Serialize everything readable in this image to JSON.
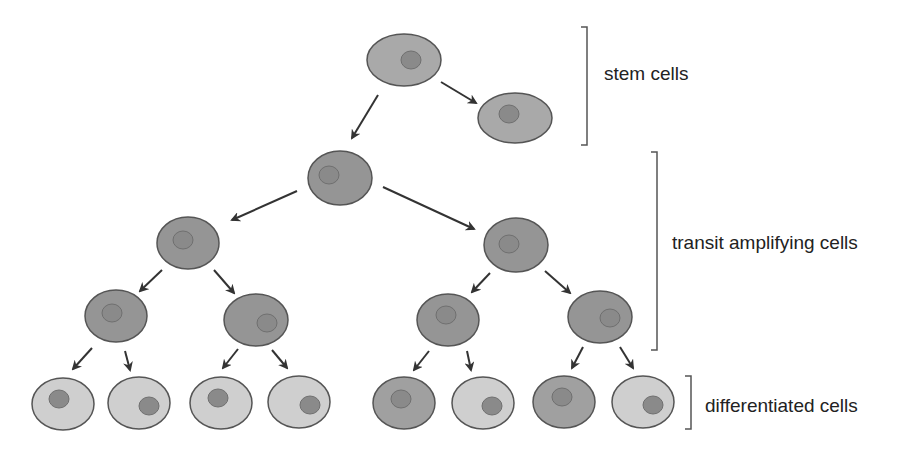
{
  "diagram": {
    "title": "",
    "labels": {
      "stem": "stem cells",
      "transit": "transit amplifying cells",
      "differentiated": "differentiated cells"
    },
    "colors": {
      "stem_fill": "#a9a9a9",
      "transit_fill": "#959595",
      "differentiated_light_fill": "#cfcfcf",
      "differentiated_dark_fill": "#a0a0a0",
      "nucleus_fill": "#8a8a8a",
      "outline": "#555555",
      "arrow": "#333333",
      "bracket": "#555555"
    },
    "nodes": [
      {
        "id": "stem-1",
        "level": "stem",
        "cx": 404,
        "cy": 60,
        "rx": 37,
        "ry": 26,
        "nx": 411,
        "ny": 60,
        "fill": "stem"
      },
      {
        "id": "stem-2",
        "level": "stem",
        "cx": 515,
        "cy": 118,
        "rx": 37,
        "ry": 25,
        "nx": 509,
        "ny": 114,
        "fill": "stem"
      },
      {
        "id": "ta-1",
        "level": "transit",
        "cx": 340,
        "cy": 178,
        "rx": 32,
        "ry": 27,
        "nx": 329,
        "ny": 175,
        "fill": "transit"
      },
      {
        "id": "ta-2",
        "level": "transit",
        "cx": 188,
        "cy": 243,
        "rx": 31,
        "ry": 26,
        "nx": 183,
        "ny": 240,
        "fill": "transit"
      },
      {
        "id": "ta-3",
        "level": "transit",
        "cx": 516,
        "cy": 245,
        "rx": 32,
        "ry": 27,
        "nx": 509,
        "ny": 244,
        "fill": "transit"
      },
      {
        "id": "ta-4",
        "level": "transit",
        "cx": 116,
        "cy": 316,
        "rx": 31,
        "ry": 26,
        "nx": 112,
        "ny": 313,
        "fill": "transit"
      },
      {
        "id": "ta-5",
        "level": "transit",
        "cx": 256,
        "cy": 320,
        "rx": 32,
        "ry": 26,
        "nx": 267,
        "ny": 323,
        "fill": "transit"
      },
      {
        "id": "ta-6",
        "level": "transit",
        "cx": 448,
        "cy": 320,
        "rx": 31,
        "ry": 26,
        "nx": 446,
        "ny": 315,
        "fill": "transit"
      },
      {
        "id": "ta-7",
        "level": "transit",
        "cx": 600,
        "cy": 317,
        "rx": 32,
        "ry": 26,
        "nx": 610,
        "ny": 318,
        "fill": "transit"
      },
      {
        "id": "diff-1",
        "level": "differentiated",
        "cx": 63,
        "cy": 404,
        "rx": 31,
        "ry": 26,
        "nx": 59,
        "ny": 399,
        "fill": "light"
      },
      {
        "id": "diff-2",
        "level": "differentiated",
        "cx": 139,
        "cy": 403,
        "rx": 31,
        "ry": 26,
        "nx": 149,
        "ny": 406,
        "fill": "light"
      },
      {
        "id": "diff-3",
        "level": "differentiated",
        "cx": 221,
        "cy": 403,
        "rx": 31,
        "ry": 26,
        "nx": 218,
        "ny": 398,
        "fill": "light"
      },
      {
        "id": "diff-4",
        "level": "differentiated",
        "cx": 299,
        "cy": 402,
        "rx": 31,
        "ry": 26,
        "nx": 310,
        "ny": 405,
        "fill": "light"
      },
      {
        "id": "diff-5",
        "level": "differentiated",
        "cx": 404,
        "cy": 403,
        "rx": 31,
        "ry": 26,
        "nx": 401,
        "ny": 399,
        "fill": "dark"
      },
      {
        "id": "diff-6",
        "level": "differentiated",
        "cx": 483,
        "cy": 403,
        "rx": 31,
        "ry": 26,
        "nx": 492,
        "ny": 406,
        "fill": "light"
      },
      {
        "id": "diff-7",
        "level": "differentiated",
        "cx": 564,
        "cy": 402,
        "rx": 31,
        "ry": 26,
        "nx": 562,
        "ny": 397,
        "fill": "dark"
      },
      {
        "id": "diff-8",
        "level": "differentiated",
        "cx": 643,
        "cy": 402,
        "rx": 31,
        "ry": 26,
        "nx": 653,
        "ny": 405,
        "fill": "light"
      }
    ],
    "arrows": [
      {
        "from": "stem-1",
        "to": "ta-1",
        "x1": 378,
        "y1": 95,
        "x2": 352,
        "y2": 138
      },
      {
        "from": "stem-1",
        "to": "stem-2",
        "x1": 441,
        "y1": 82,
        "x2": 476,
        "y2": 103
      },
      {
        "from": "ta-1",
        "to": "ta-2",
        "x1": 297,
        "y1": 191,
        "x2": 232,
        "y2": 220
      },
      {
        "from": "ta-1",
        "to": "ta-3",
        "x1": 383,
        "y1": 187,
        "x2": 474,
        "y2": 229
      },
      {
        "from": "ta-2",
        "to": "ta-4",
        "x1": 162,
        "y1": 270,
        "x2": 140,
        "y2": 291
      },
      {
        "from": "ta-2",
        "to": "ta-5",
        "x1": 214,
        "y1": 270,
        "x2": 234,
        "y2": 293
      },
      {
        "from": "ta-3",
        "to": "ta-6",
        "x1": 490,
        "y1": 273,
        "x2": 472,
        "y2": 292
      },
      {
        "from": "ta-3",
        "to": "ta-7",
        "x1": 545,
        "y1": 271,
        "x2": 570,
        "y2": 293
      },
      {
        "from": "ta-4",
        "to": "diff-1",
        "x1": 92,
        "y1": 348,
        "x2": 73,
        "y2": 369
      },
      {
        "from": "ta-4",
        "to": "diff-2",
        "x1": 125,
        "y1": 351,
        "x2": 130,
        "y2": 370
      },
      {
        "from": "ta-5",
        "to": "diff-3",
        "x1": 238,
        "y1": 349,
        "x2": 223,
        "y2": 368
      },
      {
        "from": "ta-5",
        "to": "diff-4",
        "x1": 272,
        "y1": 350,
        "x2": 287,
        "y2": 368
      },
      {
        "from": "ta-6",
        "to": "diff-5",
        "x1": 429,
        "y1": 351,
        "x2": 414,
        "y2": 370
      },
      {
        "from": "ta-6",
        "to": "diff-6",
        "x1": 467,
        "y1": 351,
        "x2": 471,
        "y2": 370
      },
      {
        "from": "ta-7",
        "to": "diff-7",
        "x1": 583,
        "y1": 347,
        "x2": 572,
        "y2": 368
      },
      {
        "from": "ta-7",
        "to": "diff-8",
        "x1": 620,
        "y1": 347,
        "x2": 633,
        "y2": 368
      }
    ],
    "brackets": [
      {
        "group": "stem",
        "x": 587,
        "y1": 27,
        "y2": 145
      },
      {
        "group": "transit",
        "x": 657,
        "y1": 152,
        "y2": 350
      },
      {
        "group": "differentiated",
        "x": 691,
        "y1": 376,
        "y2": 429
      }
    ]
  }
}
